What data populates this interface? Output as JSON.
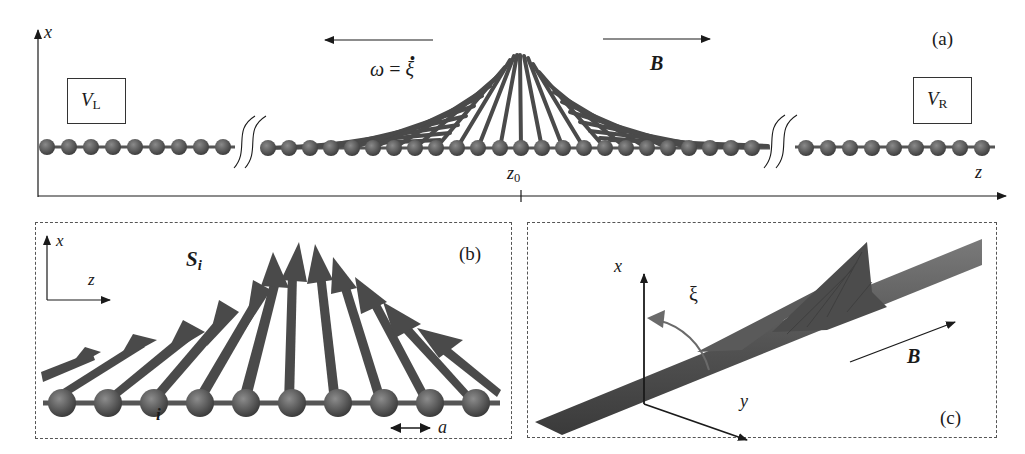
{
  "figure": {
    "panel_a": {
      "tag": "(a)",
      "axis_x_label": "x",
      "axis_z_label": "z",
      "z0_label": "z",
      "z0_sub": "0",
      "omega_label": "ω = ξ̇",
      "omega_lhs": "ω",
      "omega_eq": "=",
      "omega_rhs": "ξ",
      "field_label": "B",
      "left_box": {
        "main": "V",
        "sub": "L"
      },
      "right_box": {
        "main": "V",
        "sub": "R"
      }
    },
    "panel_b": {
      "tag": "(b)",
      "axis_x_label": "x",
      "axis_z_label": "z",
      "spin_label": "S",
      "spin_sub": "i",
      "site_label": "i",
      "spacing_label": "a"
    },
    "panel_c": {
      "tag": "(c)",
      "axis_x_label": "x",
      "axis_y_label": "y",
      "angle_label": "ξ",
      "field_label": "B"
    },
    "colors": {
      "ink": "#1a1a1a",
      "sphere": "#5a5a5a",
      "arrow": "#4a4a4a",
      "dash": "#555555"
    }
  }
}
